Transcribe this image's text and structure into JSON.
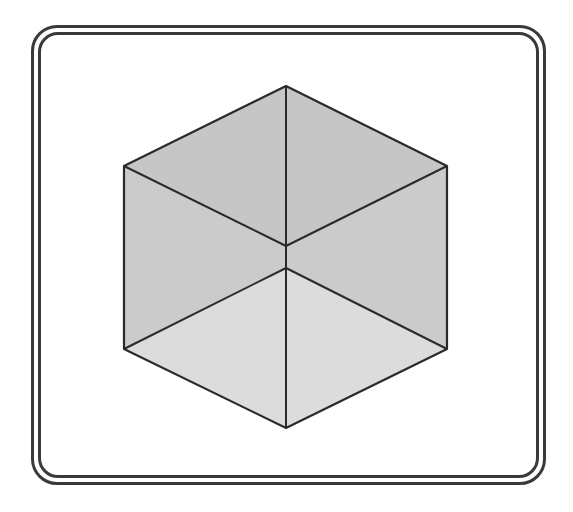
{
  "figure": {
    "title": "",
    "shape": "hexagon-cube",
    "colors": {
      "stroke": "#2a2a2a",
      "frame": "#3a3a3a",
      "face_top": "#c6c6c6",
      "face_side": "#cbcbcb",
      "face_bottom": "#dcdcdc",
      "background": "#ffffff"
    },
    "vertices": {
      "top": [
        286,
        86
      ],
      "upper_left": [
        124,
        166
      ],
      "lower_left": [
        124,
        349
      ],
      "bottom": [
        286,
        428
      ],
      "lower_right": [
        447,
        349
      ],
      "upper_right": [
        447,
        166
      ],
      "center_upper": [
        286,
        246
      ],
      "center_lower": [
        286,
        268
      ]
    }
  }
}
